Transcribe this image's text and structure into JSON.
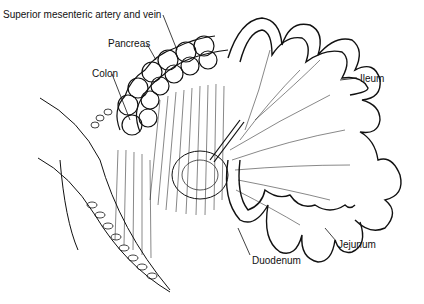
{
  "figure": {
    "type": "anatomical line illustration",
    "labels": [
      {
        "id": "sma",
        "text": "Superior mesenteric artery and vein",
        "x": 3,
        "y": 9
      },
      {
        "id": "pancreas",
        "text": "Pancreas",
        "x": 108,
        "y": 38
      },
      {
        "id": "colon",
        "text": "Colon",
        "x": 92,
        "y": 68
      },
      {
        "id": "ileum",
        "text": "Ileum",
        "x": 360,
        "y": 73
      },
      {
        "id": "jejunum",
        "text": "Jejunum",
        "x": 338,
        "y": 239
      },
      {
        "id": "duodenum",
        "text": "Duodenum",
        "x": 252,
        "y": 255
      }
    ],
    "colors": {
      "ink": "#111111",
      "background": "#ffffff"
    }
  }
}
